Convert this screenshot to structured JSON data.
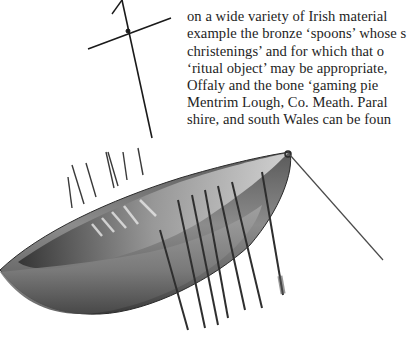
{
  "page": {
    "type": "scanned-book-page"
  },
  "text_column": {
    "lines": [
      "",
      "on a wide variety of Irish material",
      "example the bronze ‘spoons’ whose s",
      "christenings’ and for which that o",
      "‘ritual object’ may be appropriate,",
      "Offaly and the bone ‘gaming pie",
      "Mentrim Lough, Co. Meath. Paral",
      "shire, and south Wales can be foun"
    ]
  },
  "figure": {
    "colors": {
      "hull_dark": "#3a3a3a",
      "hull_mid": "#7a7a7a",
      "hull_light": "#c8c8c8",
      "oar": "#2e2e2e",
      "background": "#ffffff"
    }
  }
}
